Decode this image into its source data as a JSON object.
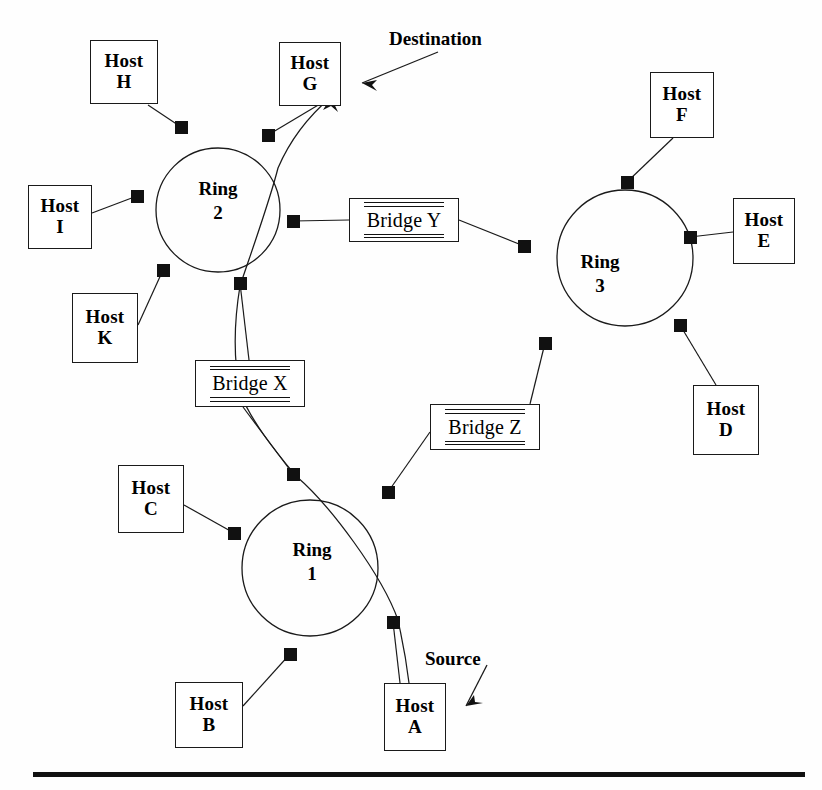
{
  "diagram": {
    "ink_color": "#111111",
    "background_color": "#ffffff"
  },
  "annotations": [
    {
      "name": "destination",
      "label": "Destination",
      "x": 389,
      "y": 28
    },
    {
      "name": "source",
      "label": "Source",
      "x": 425,
      "y": 648
    }
  ],
  "rings": [
    {
      "id": "ring2",
      "line1": "Ring",
      "line2": "2",
      "cx": 218,
      "cy": 210,
      "r": 62,
      "label_x": 218,
      "label_y": 177
    },
    {
      "id": "ring3",
      "line1": "Ring",
      "line2": "3",
      "cx": 625,
      "cy": 258,
      "r": 68,
      "label_x": 600,
      "label_y": 250
    },
    {
      "id": "ring1",
      "line1": "Ring",
      "line2": "1",
      "cx": 310,
      "cy": 568,
      "r": 68,
      "label_x": 312,
      "label_y": 538
    }
  ],
  "hosts": [
    {
      "id": "host-h",
      "line1": "Host",
      "line2": "H",
      "x": 90,
      "y": 40,
      "w": 68,
      "h": 64
    },
    {
      "id": "host-g",
      "line1": "Host",
      "line2": "G",
      "x": 279,
      "y": 42,
      "w": 62,
      "h": 64
    },
    {
      "id": "host-i",
      "line1": "Host",
      "line2": "I",
      "x": 28,
      "y": 185,
      "w": 64,
      "h": 64
    },
    {
      "id": "host-k",
      "line1": "Host",
      "line2": "K",
      "x": 72,
      "y": 293,
      "w": 66,
      "h": 70
    },
    {
      "id": "host-f",
      "line1": "Host",
      "line2": "F",
      "x": 650,
      "y": 72,
      "w": 64,
      "h": 66
    },
    {
      "id": "host-e",
      "line1": "Host",
      "line2": "E",
      "x": 733,
      "y": 198,
      "w": 62,
      "h": 66
    },
    {
      "id": "host-d",
      "line1": "Host",
      "line2": "D",
      "x": 693,
      "y": 385,
      "w": 66,
      "h": 70
    },
    {
      "id": "host-c",
      "line1": "Host",
      "line2": "C",
      "x": 118,
      "y": 465,
      "w": 66,
      "h": 68
    },
    {
      "id": "host-b",
      "line1": "Host",
      "line2": "B",
      "x": 175,
      "y": 682,
      "w": 68,
      "h": 66
    },
    {
      "id": "host-a",
      "line1": "Host",
      "line2": "A",
      "x": 384,
      "y": 683,
      "w": 62,
      "h": 68
    }
  ],
  "bridges": [
    {
      "id": "bridge-y",
      "label": "Bridge Y",
      "x": 349,
      "y": 198,
      "w": 110,
      "h": 44
    },
    {
      "id": "bridge-x",
      "label": "Bridge X",
      "x": 195,
      "y": 360,
      "w": 110,
      "h": 47
    },
    {
      "id": "bridge-z",
      "label": "Bridge Z",
      "x": 430,
      "y": 404,
      "w": 110,
      "h": 46
    }
  ],
  "nodes": [
    {
      "id": "n-r2-nw",
      "ring": "ring2",
      "x": 181,
      "y": 127
    },
    {
      "id": "n-r2-ne",
      "ring": "ring2",
      "x": 268,
      "y": 135
    },
    {
      "id": "n-r2-w",
      "ring": "ring2",
      "x": 137,
      "y": 196
    },
    {
      "id": "n-r2-e",
      "ring": "ring2",
      "x": 293,
      "y": 221
    },
    {
      "id": "n-r2-sw",
      "ring": "ring2",
      "x": 163,
      "y": 270
    },
    {
      "id": "n-r2-s",
      "ring": "ring2",
      "x": 240,
      "y": 283
    },
    {
      "id": "n-r3-n",
      "ring": "ring3",
      "x": 627,
      "y": 182
    },
    {
      "id": "n-r3-w",
      "ring": "ring3",
      "x": 524,
      "y": 246
    },
    {
      "id": "n-r3-e",
      "ring": "ring3",
      "x": 690,
      "y": 237
    },
    {
      "id": "n-r3-sw",
      "ring": "ring3",
      "x": 545,
      "y": 343
    },
    {
      "id": "n-r3-se",
      "ring": "ring3",
      "x": 680,
      "y": 325
    },
    {
      "id": "n-r1-n",
      "ring": "ring1",
      "x": 293,
      "y": 474
    },
    {
      "id": "n-r1-ne",
      "ring": "ring1",
      "x": 388,
      "y": 492
    },
    {
      "id": "n-r1-w",
      "ring": "ring1",
      "x": 234,
      "y": 533
    },
    {
      "id": "n-r1-e",
      "ring": "ring1",
      "x": 393,
      "y": 622
    },
    {
      "id": "n-r1-s",
      "ring": "ring1",
      "x": 290,
      "y": 654
    }
  ],
  "links": [
    {
      "id": "link-h",
      "from": "Host H",
      "to": "n-r2-nw",
      "path": "M148,105 L181,127"
    },
    {
      "id": "link-i",
      "from": "Host I",
      "to": "n-r2-w",
      "path": "M92,213 L137,196"
    },
    {
      "id": "link-k",
      "from": "Host K",
      "to": "n-r2-sw",
      "path": "M138,325 L163,270"
    },
    {
      "id": "link-g",
      "from": "n-r2-ne",
      "to": "Host G",
      "path": "M268,135 L330,98"
    },
    {
      "id": "link-by-r2",
      "from": "n-r2-e",
      "to": "Bridge Y",
      "path": "M293,221 L349,220"
    },
    {
      "id": "link-by-r3",
      "from": "Bridge Y",
      "to": "n-r3-w",
      "path": "M459,220 L524,246"
    },
    {
      "id": "link-f",
      "from": "Host F",
      "to": "n-r3-n",
      "path": "M673,138 L627,182"
    },
    {
      "id": "link-e",
      "from": "n-r3-e",
      "to": "Host E",
      "path": "M690,237 L733,232"
    },
    {
      "id": "link-d",
      "from": "n-r3-se",
      "to": "Host D",
      "path": "M680,325 L716,385"
    },
    {
      "id": "link-bz-r3",
      "from": "n-r3-sw",
      "to": "Bridge Z",
      "path": "M545,343 L530,404"
    },
    {
      "id": "link-bz-r1",
      "from": "Bridge Z",
      "to": "n-r1-ne",
      "path": "M430,432 L388,492"
    },
    {
      "id": "link-bx-r2",
      "from": "n-r2-s",
      "to": "Bridge X",
      "path": "M240,283 L249,360"
    },
    {
      "id": "link-bx-r1",
      "from": "Bridge X",
      "to": "n-r1-n",
      "path": "M243,407 L293,474"
    },
    {
      "id": "link-c",
      "from": "Host C",
      "to": "n-r1-w",
      "path": "M184,505 L234,533"
    },
    {
      "id": "link-b",
      "from": "Host B",
      "to": "n-r1-s",
      "path": "M243,706 L290,654"
    },
    {
      "id": "link-a",
      "from": "Host A",
      "to": "n-r1-e",
      "path": "M400,683 L393,622"
    }
  ],
  "route": {
    "name": "source-to-destination-path",
    "from": "Host A",
    "to": "Host G",
    "segments": [
      "M409,683 C405,650 402,640 398,620 C382,575 330,505 296,476",
      "M296,476 C276,452 250,420 240,392 C232,352 236,310 240,286",
      "M240,286 C252,250 270,200 278,168 C290,140 310,115 331,97"
    ]
  },
  "route_arrowheads": [
    {
      "id": "arrow-to-host-g",
      "points": "331,97 323,110 331,106 338,112"
    }
  ],
  "annotation_arrows": [
    {
      "id": "destination-arrow",
      "path": "M438,52 L362,83",
      "head": "362,83 377,80 372,85 377,91"
    },
    {
      "id": "source-arrow",
      "path": "M487,665 L466,706",
      "head": "466,706 474,695 475,702 483,703"
    }
  ],
  "base_rule": {
    "id": "bottom-rule",
    "x": 33,
    "y": 772,
    "width": 772,
    "height": 5
  }
}
